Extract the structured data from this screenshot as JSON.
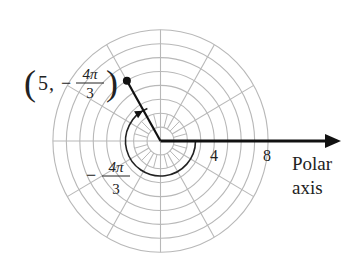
{
  "diagram": {
    "type": "polar-coordinate-plot",
    "grid": {
      "center": [
        160.5,
        141
      ],
      "ring_count": 8,
      "unit_px_x": 13.45,
      "unit_px_y": 13.9,
      "spoke_step_deg": 30,
      "grid_color": "#b8b8b8"
    },
    "point": {
      "label_r": "5",
      "label_theta_num": "4π",
      "label_theta_den": "3",
      "label_sign": "−",
      "r": 5,
      "theta": "-4π/3",
      "color": "#111111"
    },
    "angle_arc": {
      "label_sign": "−",
      "label_num": "4π",
      "label_den": "3",
      "radius_px": 35,
      "start_deg": 0,
      "sweep_deg": -240
    },
    "axis": {
      "tick_labels": [
        "4",
        "8"
      ],
      "label_line1": "Polar",
      "label_line2": "axis",
      "color": "#111111"
    }
  }
}
